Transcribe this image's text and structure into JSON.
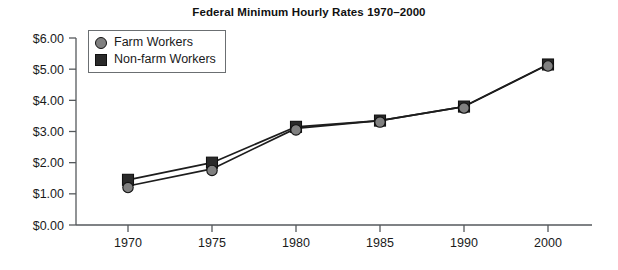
{
  "chart_data": {
    "type": "line",
    "title": "Federal Minimum Hourly Rates 1970–2000",
    "xlabel": "",
    "ylabel": "",
    "categories": [
      "1970",
      "1975",
      "1980",
      "1985",
      "1990",
      "2000"
    ],
    "series": [
      {
        "name": "Farm Workers",
        "marker": "circle",
        "color": "#808080",
        "values": [
          1.25,
          1.8,
          3.1,
          3.35,
          3.8,
          5.15
        ]
      },
      {
        "name": "Non-farm Workers",
        "marker": "square",
        "color": "#2a2a2a",
        "values": [
          1.45,
          2.0,
          3.15,
          3.35,
          3.8,
          5.15
        ]
      }
    ],
    "ylim": [
      0,
      6
    ],
    "ytick_values": [
      0,
      1,
      2,
      3,
      4,
      5,
      6
    ],
    "ytick_labels": [
      "$0.00",
      "$1.00",
      "$2.00",
      "$3.00",
      "$4.00",
      "$5.00",
      "$6.00"
    ],
    "grid": false,
    "legend_position": "upper-left-inside",
    "line_color": "#1d1d1d",
    "axis_color": "#55595c",
    "background": "#ffffff"
  },
  "legend": {
    "entries": [
      {
        "label": "Farm Workers"
      },
      {
        "label": "Non-farm Workers"
      }
    ]
  }
}
